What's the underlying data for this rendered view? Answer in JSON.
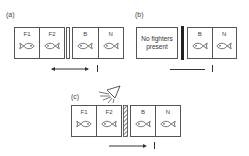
{
  "panels": [
    {
      "label": "(a)",
      "left_tank": {
        "cells": [
          {
            "label": "F1"
          },
          {
            "label": "F2"
          }
        ]
      },
      "divider": "opaque-open",
      "right_tank": {
        "cells": [
          {
            "label": "B"
          },
          {
            "label": "N"
          }
        ]
      },
      "indicator": "double-arrow",
      "marker": "I"
    },
    {
      "label": "(b)",
      "left_tank": {
        "message_line1": "No fighters",
        "message_line2": "present"
      },
      "divider": "solid-black",
      "right_tank": {
        "cells": [
          {
            "label": "B"
          },
          {
            "label": "N"
          }
        ]
      },
      "indicator": "line",
      "marker": "I"
    },
    {
      "label": "(c)",
      "left_tank": {
        "cells": [
          {
            "label": "F1"
          },
          {
            "label": "F2"
          }
        ]
      },
      "divider": "one-way-mirror-hatched",
      "right_tank": {
        "cells": [
          {
            "label": "B"
          },
          {
            "label": "N"
          }
        ]
      },
      "indicator": "right-arrow",
      "marker": "I",
      "lamp": "lamp-icon"
    }
  ],
  "colors": {
    "line": "#555555",
    "bar": "#222222",
    "background": "#ffffff"
  }
}
